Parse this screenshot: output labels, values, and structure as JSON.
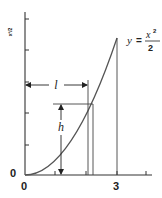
{
  "diagram": {
    "title": "",
    "equation": {
      "lhs": "y",
      "equals": "=",
      "numerator": "x",
      "exponent": "2",
      "denominator": "2"
    },
    "y_axis_label": "x²/2",
    "origin_labels": {
      "left": "0",
      "bottom": "0"
    },
    "x_tick_labels": [
      {
        "value": 3,
        "label": "3"
      }
    ],
    "x_ticks": [
      1,
      2,
      3,
      4
    ],
    "y_ticks": [
      1,
      2,
      3,
      4,
      5
    ],
    "annotations": {
      "length_label": "l",
      "height_label": "h"
    },
    "curve": "y = x^2/2, x from 0 to 3",
    "colors": {
      "line": "#333333",
      "curve": "#555555",
      "background": "#ffffff"
    }
  }
}
